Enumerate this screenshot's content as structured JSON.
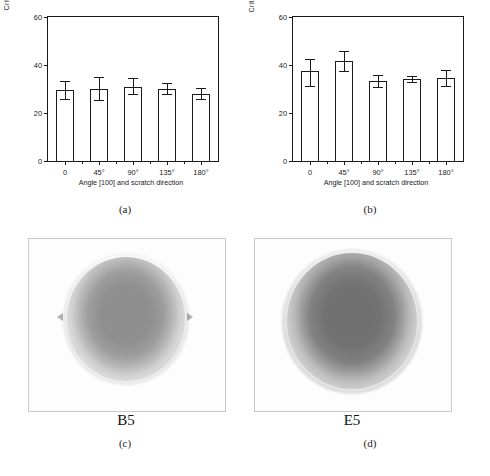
{
  "figure": {
    "panels": [
      {
        "caption": "(a)"
      },
      {
        "caption": "(b)"
      },
      {
        "caption": "(c)"
      },
      {
        "caption": "(d)"
      }
    ]
  },
  "captions": {
    "a": "(a)",
    "b": "(b)",
    "c": "(c)",
    "d": "(d)"
  },
  "micrographs": {
    "c": {
      "label": "B5"
    },
    "d": {
      "label": "E5"
    }
  },
  "chart_data": [
    {
      "type": "bar",
      "panel": "(a)",
      "title": "",
      "xlabel": "Angle [100] and scratch direction",
      "ylabel": "Critical load  (N)",
      "categories": [
        "0",
        "45°",
        "90°",
        "135°",
        "180°"
      ],
      "values": [
        29.5,
        30.0,
        31.0,
        30.0,
        28.0
      ],
      "errors_upper": [
        4.0,
        5.0,
        3.5,
        2.5,
        2.5
      ],
      "errors_lower": [
        4.0,
        5.0,
        3.5,
        2.5,
        2.5
      ],
      "ylim": [
        0,
        60
      ],
      "yticks": [
        0,
        20,
        40,
        60
      ],
      "ytick_labels": [
        "0",
        "20",
        "40",
        "60"
      ],
      "grid": false,
      "legend": "none",
      "frame": "box"
    },
    {
      "type": "bar",
      "panel": "(b)",
      "title": "",
      "xlabel": "Angle [100] and scratch direction",
      "ylabel": "Critical load  (N)",
      "categories": [
        "0",
        "45°",
        "90°",
        "135°",
        "180°"
      ],
      "values": [
        37.5,
        41.5,
        33.5,
        34.0,
        34.5
      ],
      "errors_upper": [
        5.0,
        4.5,
        2.5,
        1.5,
        3.5
      ],
      "errors_lower": [
        6.5,
        4.5,
        3.0,
        1.5,
        3.5
      ],
      "ylim": [
        0,
        60
      ],
      "yticks": [
        0,
        20,
        40,
        60
      ],
      "ytick_labels": [
        "0",
        "20",
        "40",
        "60"
      ],
      "grid": false,
      "legend": "none",
      "frame": "box"
    }
  ],
  "colors": {
    "axis": "#1a1a1a",
    "bar_fill": "#ffffff",
    "bar_edge": "#1a1a1a",
    "panel_border": "#c9c9c9"
  }
}
